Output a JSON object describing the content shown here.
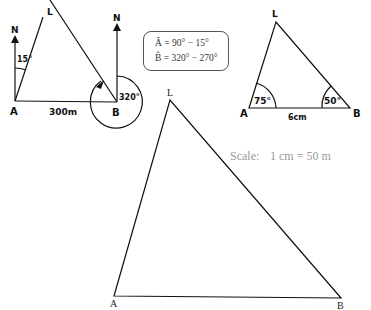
{
  "sketch_bearing": {
    "point_a": "A",
    "point_b": "B",
    "point_l": "L",
    "north_a": "N",
    "north_b": "N",
    "angle_a": "15°",
    "angle_b": "320°",
    "distance": "300m"
  },
  "formulas": {
    "line_a": "Â = 90° − 15°",
    "line_b": "B̂ = 320° − 270°"
  },
  "sketch_triangle": {
    "point_a": "A",
    "point_b": "B",
    "point_l": "L",
    "angle_a": "75°",
    "angle_b": "50°",
    "side_ab": "6cm"
  },
  "scale": {
    "label": "Scale:",
    "value": "1 cm = 50 m"
  },
  "scale_drawing": {
    "point_a": "A",
    "point_b": "B",
    "point_l": "L"
  },
  "colors": {
    "ink": "#111111",
    "scale_text": "#9a9a9a",
    "box_border": "#555555"
  }
}
